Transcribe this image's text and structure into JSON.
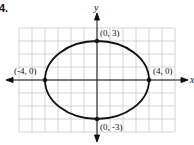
{
  "problem_number": "4.",
  "chart_data": {
    "type": "line",
    "title": "",
    "xlabel": "x",
    "ylabel": "y",
    "xlim": [
      -6,
      6
    ],
    "ylim": [
      -4,
      4
    ],
    "grid": true,
    "curve": {
      "shape": "ellipse",
      "center": [
        0,
        0
      ],
      "a": 4,
      "b": 3,
      "equation": "x^2/16 + y^2/9 = 1"
    },
    "points": [
      {
        "x": 0,
        "y": 3,
        "label": "(0, 3)"
      },
      {
        "x": -4,
        "y": 0,
        "label": "(-4, 0)"
      },
      {
        "x": 4,
        "y": 0,
        "label": "(4, 0)"
      },
      {
        "x": 0,
        "y": -3,
        "label": "(0, -3)"
      }
    ]
  }
}
